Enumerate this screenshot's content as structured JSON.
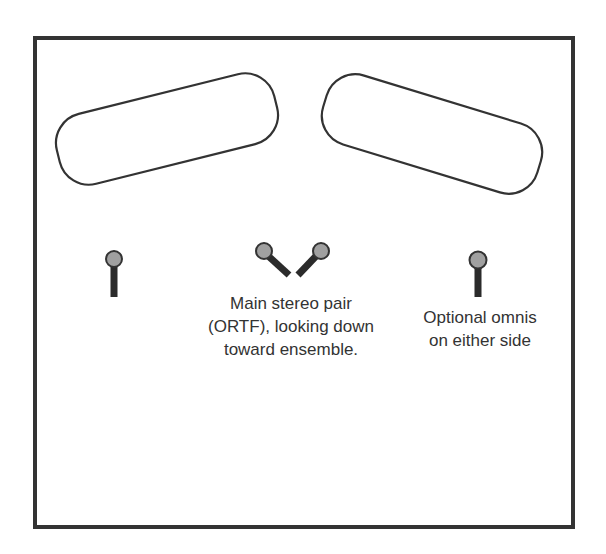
{
  "diagram": {
    "type": "microphone placement diagram",
    "frame": {
      "stroke_color": "#333333"
    },
    "ensemble_areas": [
      {
        "id": "left-ensemble-area",
        "shape": "rounded-rectangle",
        "rotation_deg": -14
      },
      {
        "id": "right-ensemble-area",
        "shape": "rounded-rectangle",
        "rotation_deg": 17
      }
    ],
    "microphones": [
      {
        "id": "left-omni-mic",
        "role": "optional omni",
        "orientation": "vertical"
      },
      {
        "id": "ortf-left-mic",
        "role": "main stereo pair (ORTF)",
        "orientation": "angled left"
      },
      {
        "id": "ortf-right-mic",
        "role": "main stereo pair (ORTF)",
        "orientation": "angled right"
      },
      {
        "id": "right-omni-mic",
        "role": "optional omni",
        "orientation": "vertical"
      }
    ],
    "colors": {
      "mic_head": "#a0a0a0",
      "mic_stem": "#2b2b2b",
      "outline": "#333333",
      "text": "#333333"
    }
  },
  "labels": {
    "main_pair": {
      "lines": [
        "Main stereo pair",
        "(ORTF), looking down",
        "toward ensemble."
      ]
    },
    "omnis": {
      "lines": [
        "Optional omnis",
        "on either side"
      ]
    }
  }
}
